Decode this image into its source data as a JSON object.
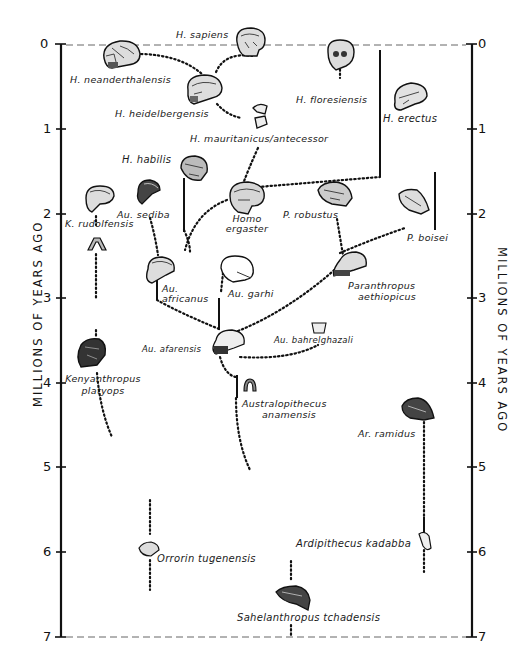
{
  "axis": {
    "title": "MILLIONS OF YEARS AGO",
    "ticks": [
      "0",
      "1",
      "2",
      "3",
      "4",
      "5",
      "6",
      "7"
    ]
  },
  "species": {
    "h_sapiens": "H. sapiens",
    "h_neanderthalensis": "H. neanderthalensis",
    "h_heidelbergensis": "H. heidelbergensis",
    "h_floresiensis": "H. floresiensis",
    "h_erectus": "H. erectus",
    "h_mauritanicus": "H. mauritanicus/antecessor",
    "h_habilis": "H. habilis",
    "k_rudolfensis": "K. rudolfensis",
    "au_sediba": "Au. sediba",
    "homo_ergaster_1": "Homo",
    "homo_ergaster_2": "ergaster",
    "p_robustus": "P. robustus",
    "p_boisei": "P. boisei",
    "au_africanus_1": "Au.",
    "au_africanus_2": "africanus",
    "au_garhi": "Au. garhi",
    "p_aethiopicus_1": "Paranthropus",
    "p_aethiopicus_2": "aethiopicus",
    "au_afarensis": "Au. afarensis",
    "au_bahrelghazali": "Au. bahrelghazali",
    "kenyanthropus_1": "Kenyanthropus",
    "kenyanthropus_2": "platyops",
    "au_anamensis_1": "Australopithecus",
    "au_anamensis_2": "anamensis",
    "ar_ramidus": "Ar. ramidus",
    "ar_kadabba": "Ardipithecus kadabba",
    "orrorin": "Orrorin tugenensis",
    "sahelanthropus": "Sahelanthropus tchadensis"
  }
}
